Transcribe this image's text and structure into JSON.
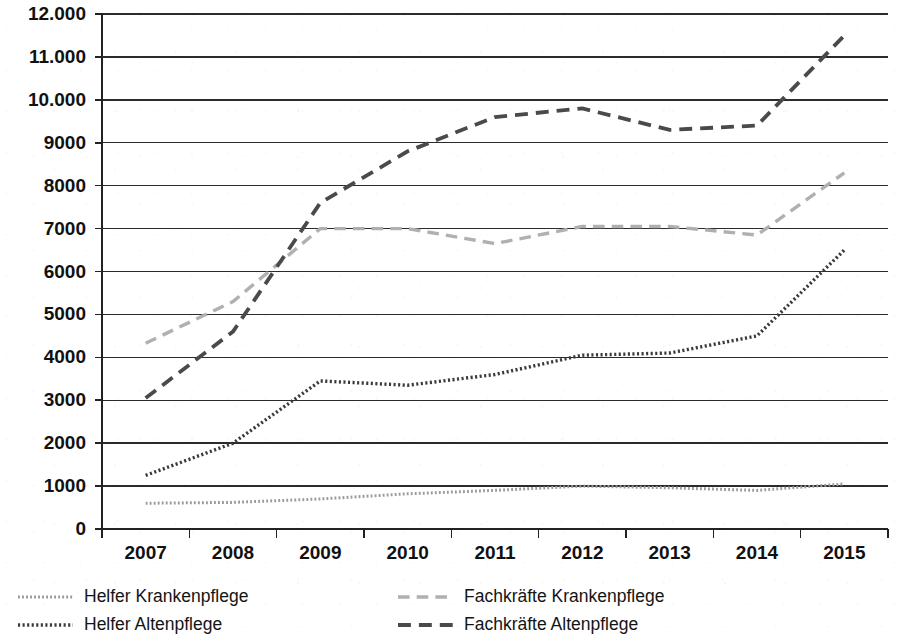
{
  "chart_data": {
    "type": "line",
    "title": "",
    "subtitle": "",
    "xlabel": "",
    "ylabel": "",
    "categories": [
      "2007",
      "2008",
      "2009",
      "2010",
      "2011",
      "2012",
      "2013",
      "2014",
      "2015"
    ],
    "x_tick_labels": [
      "2007",
      "2008",
      "2009",
      "2010",
      "2011",
      "2012",
      "2013",
      "2014",
      "2015"
    ],
    "y_tick_labels": [
      "0",
      "1000",
      "2000",
      "3000",
      "4000",
      "5000",
      "6000",
      "7000",
      "8000",
      "9000",
      "10.000",
      "11.000",
      "12.000"
    ],
    "y_tick_values": [
      0,
      1000,
      2000,
      3000,
      4000,
      5000,
      6000,
      7000,
      8000,
      9000,
      10000,
      11000,
      12000
    ],
    "ylim": [
      0,
      12000
    ],
    "grid": true,
    "grid_axis": "y",
    "legend_position": "bottom",
    "legend_columns": 2,
    "series": [
      {
        "name": "Helfer Krankenpflege",
        "values": [
          600,
          620,
          700,
          820,
          900,
          1000,
          960,
          900,
          1050
        ],
        "color": "#9a9a9a",
        "style": "dotted",
        "width": 3
      },
      {
        "name": "Helfer Altenpflege",
        "values": [
          1250,
          2000,
          3450,
          3350,
          3600,
          4050,
          4100,
          4500,
          6500
        ],
        "color": "#3a3a3a",
        "style": "dotted",
        "width": 3.4
      },
      {
        "name": "Fachkräfte Krankenpflege",
        "values": [
          4330,
          5300,
          7000,
          7000,
          6650,
          7050,
          7050,
          6850,
          8300
        ],
        "color": "#b0b0b0",
        "style": "dashed",
        "width": 3.4
      },
      {
        "name": "Fachkräfte Altenpflege",
        "values": [
          3050,
          4600,
          7600,
          8800,
          9600,
          9800,
          9300,
          9400,
          11500
        ],
        "color": "#4a4a4a",
        "style": "dashed",
        "width": 3.8
      }
    ]
  },
  "legend": {
    "entries": [
      {
        "label": "Helfer Krankenpflege",
        "series_index": 0
      },
      {
        "label": "Fachkräfte Krankenpflege",
        "series_index": 2
      },
      {
        "label": "Helfer Altenpflege",
        "series_index": 1
      },
      {
        "label": "Fachkräfte Altenpflege",
        "series_index": 3
      }
    ]
  },
  "colors": {
    "axis": "#222222",
    "grid": "#2b2b2b",
    "background": "#ffffff",
    "text": "#111111"
  }
}
